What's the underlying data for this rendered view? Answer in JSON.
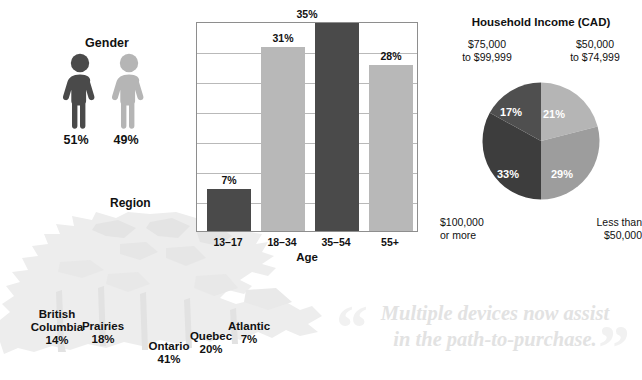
{
  "gender": {
    "title": "Gender",
    "male_pct": "51%",
    "female_pct": "49%",
    "male_color": "#4a4a4a",
    "female_color": "#b5b5b5"
  },
  "region": {
    "title": "Region",
    "items": [
      {
        "name": "British\nColumbia",
        "name_line1": "British",
        "name_line2": "Columbia",
        "value": "14%"
      },
      {
        "name": "Prairies",
        "name_line1": "Prairies",
        "name_line2": "",
        "value": "18%"
      },
      {
        "name": "Ontario",
        "name_line1": "Ontario",
        "name_line2": "",
        "value": "41%"
      },
      {
        "name": "Quebec",
        "name_line1": "Quebec",
        "name_line2": "",
        "value": "20%"
      },
      {
        "name": "Atlantic",
        "name_line1": "Atlantic",
        "name_line2": "",
        "value": "7%"
      }
    ]
  },
  "chart_data": [
    {
      "type": "bar",
      "title": "",
      "xlabel": "Age",
      "ylabel": "",
      "categories": [
        "13–17",
        "18–34",
        "35–54",
        "55+"
      ],
      "values": [
        7,
        31,
        35,
        28
      ],
      "value_labels": [
        "7%",
        "31%",
        "35%",
        "28%"
      ],
      "colors": [
        "#4a4a4a",
        "#b8b8b8",
        "#4a4a4a",
        "#b8b8b8"
      ],
      "ylim": [
        0,
        35
      ],
      "grid": true,
      "gridline_count": 7,
      "legend": "none"
    },
    {
      "type": "pie",
      "title": "Household Income (CAD)",
      "labels": [
        "$50,000 to $74,999",
        "Less than $50,000",
        "$100,000 or more",
        "$75,000 to $99,999"
      ],
      "values": [
        21,
        29,
        33,
        17
      ],
      "value_labels": [
        "21%",
        "29%",
        "33%",
        "17%"
      ],
      "colors": [
        "#b5b5b5",
        "#9d9d9d",
        "#3d3d3d",
        "#4f4f4f"
      ],
      "legend": "corners",
      "corner_labels": {
        "top_left_line1": "$75,000",
        "top_left_line2": "to $99,999",
        "top_right_line1": "$50,000",
        "top_right_line2": "to $74,999",
        "bottom_left_line1": "$100,000",
        "bottom_left_line2": "or more",
        "bottom_right_line1": "Less than",
        "bottom_right_line2": "$50,000"
      }
    }
  ],
  "tagline": {
    "line1": "Multiple devices now assist",
    "line2": "in the path-to-purchase.",
    "quote_open": "“",
    "quote_close": "”"
  }
}
